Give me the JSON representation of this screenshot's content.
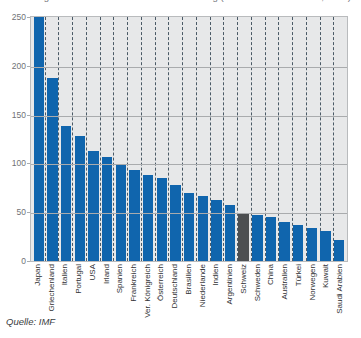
{
  "figure": {
    "title_clipped": "Abbildung 4.3:  Internationale Staatsverschuldung (Schulden in % des BIP, 2011)",
    "source_label": "Quelle: IMF",
    "highlight_color": "#4d4f51",
    "bar_color": "#1065ad",
    "plot_background": "#e7e8e9"
  },
  "chart_data": {
    "type": "bar",
    "title": "Abbildung 4.3:  Internationale Staatsverschuldung (Schulden in % des BIP, 2011)",
    "xlabel": "",
    "ylabel": "",
    "ylim": [
      0,
      250
    ],
    "yticks": [
      0,
      50,
      100,
      150,
      200,
      250
    ],
    "ytick_labels": [
      "0",
      "50",
      "100",
      "150",
      "200",
      "250"
    ],
    "grid": true,
    "legend": "none",
    "categories": [
      "Japan",
      "Griechenland",
      "Italien",
      "Portugal",
      "USA",
      "Irland",
      "Spanien",
      "Frankreich",
      "Ver. Königreich",
      "Österreich",
      "Deutschland",
      "Brasilien",
      "Niederlande",
      "Indien",
      "Argentinien",
      "Schweiz",
      "Schweden",
      "China",
      "Australien",
      "Türkei",
      "Norwegen",
      "Kuwait",
      "Saudi Arabien"
    ],
    "values": [
      250,
      188,
      138,
      128,
      113,
      107,
      98,
      93,
      88,
      85,
      78,
      70,
      67,
      63,
      57,
      48,
      47,
      45,
      40,
      37,
      34,
      31,
      22
    ],
    "highlight_index": 15,
    "source": "Quelle: IMF"
  }
}
